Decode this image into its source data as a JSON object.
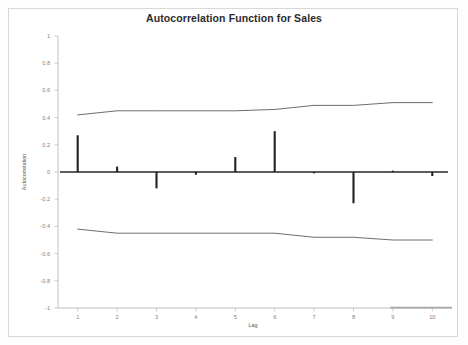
{
  "chart_data": {
    "type": "bar",
    "title": "Autocorrelation Function for Sales",
    "xlabel": "Lag",
    "ylabel": "Autocorrelation",
    "x": [
      1,
      2,
      3,
      4,
      5,
      6,
      7,
      8,
      9,
      10
    ],
    "categories": [
      "1",
      "2",
      "3",
      "4",
      "5",
      "6",
      "7",
      "8",
      "9",
      "10"
    ],
    "values": [
      0.27,
      0.04,
      -0.12,
      -0.02,
      0.11,
      0.3,
      -0.01,
      -0.23,
      0.01,
      -0.03
    ],
    "series": [
      {
        "name": "Autocorrelation",
        "values": [
          0.27,
          0.04,
          -0.12,
          -0.02,
          0.11,
          0.3,
          -0.01,
          -0.23,
          0.01,
          -0.03
        ]
      },
      {
        "name": "Upper confidence limit",
        "values": [
          0.42,
          0.45,
          0.45,
          0.45,
          0.45,
          0.46,
          0.49,
          0.49,
          0.51,
          0.51
        ]
      },
      {
        "name": "Lower confidence limit",
        "values": [
          -0.42,
          -0.45,
          -0.45,
          -0.45,
          -0.45,
          -0.45,
          -0.48,
          -0.48,
          -0.5,
          -0.5
        ]
      }
    ],
    "ylim": [
      -1,
      1
    ],
    "xlim": [
      0.5,
      10.5
    ],
    "yticks": [
      1,
      0.8,
      0.6,
      0.4,
      0.2,
      0,
      -0.2,
      -0.4,
      -0.6,
      -0.8,
      -1
    ],
    "ytick_labels": [
      "1",
      "0.8",
      "0.6",
      "0.4",
      "0.2",
      "0",
      "-0.2",
      "-0.4",
      "-0.6",
      "-0.8",
      "-1"
    ],
    "xticks": [
      1,
      2,
      3,
      4,
      5,
      6,
      7,
      8,
      9,
      10
    ],
    "grid": false,
    "legend": "none",
    "colors": {
      "spike": "#222222",
      "confidence_band": "#6e6e6e",
      "zero_line": "#262626",
      "axis": "#b9b9b9",
      "title_text": "#2b2b2b",
      "tick_text": "#808080"
    }
  }
}
